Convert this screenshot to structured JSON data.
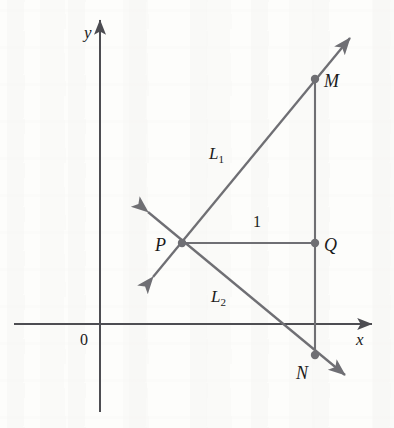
{
  "figure": {
    "kind": "coordinate-geometry-diagram",
    "width": 394,
    "height": 428,
    "background_color": "#fdfdfb"
  },
  "style": {
    "axis_color": "#4d4d52",
    "line_color": "#6f6f74",
    "point_color": "#6f6f74",
    "label_color": "#1a1a1a",
    "axis_stroke_width": 2,
    "line_stroke_width": 2.3,
    "point_radius": 4
  },
  "axes": {
    "origin": {
      "x": 100,
      "y": 324,
      "label": "0",
      "label_x": 80,
      "label_y": 332
    },
    "x_axis": {
      "label": "x",
      "label_x": 356,
      "label_y": 331,
      "from_x": 14,
      "to_x": 372,
      "y": 324,
      "arrow": "right"
    },
    "y_axis": {
      "label": "y",
      "label_x": 84,
      "label_y": 24,
      "x": 100,
      "from_y": 412,
      "to_y": 20,
      "arrow": "up"
    }
  },
  "points": [
    {
      "id": "P",
      "label": "P",
      "x": 182,
      "y": 243,
      "label_x": 155,
      "label_y": 236,
      "dot": true
    },
    {
      "id": "M",
      "label": "M",
      "x": 315,
      "y": 79,
      "label_x": 324,
      "label_y": 72,
      "dot": true
    },
    {
      "id": "Q",
      "label": "Q",
      "x": 315,
      "y": 243,
      "label_x": 324,
      "label_y": 236,
      "dot": true
    },
    {
      "id": "N",
      "label": "N",
      "x": 315,
      "y": 355,
      "label_x": 296,
      "label_y": 364,
      "dot": true
    }
  ],
  "lines": [
    {
      "id": "L1",
      "label": "L",
      "label_sub": "1",
      "label_x": 209,
      "label_y": 145,
      "x1": 153,
      "y1": 277,
      "x2": 350,
      "y2": 38,
      "arrow_start": true,
      "arrow_end": true
    },
    {
      "id": "L2",
      "label": "L",
      "label_sub": "2",
      "label_x": 211,
      "label_y": 288,
      "x1": 148,
      "y1": 212,
      "x2": 345,
      "y2": 375,
      "arrow_start": true,
      "arrow_end": true
    }
  ],
  "segments": [
    {
      "id": "PQ",
      "label": "1",
      "label_x": 253,
      "label_y": 214,
      "x1": 182,
      "y1": 243,
      "x2": 315,
      "y2": 243
    },
    {
      "id": "MN",
      "label": "",
      "x1": 315,
      "y1": 79,
      "x2": 315,
      "y2": 355
    }
  ]
}
